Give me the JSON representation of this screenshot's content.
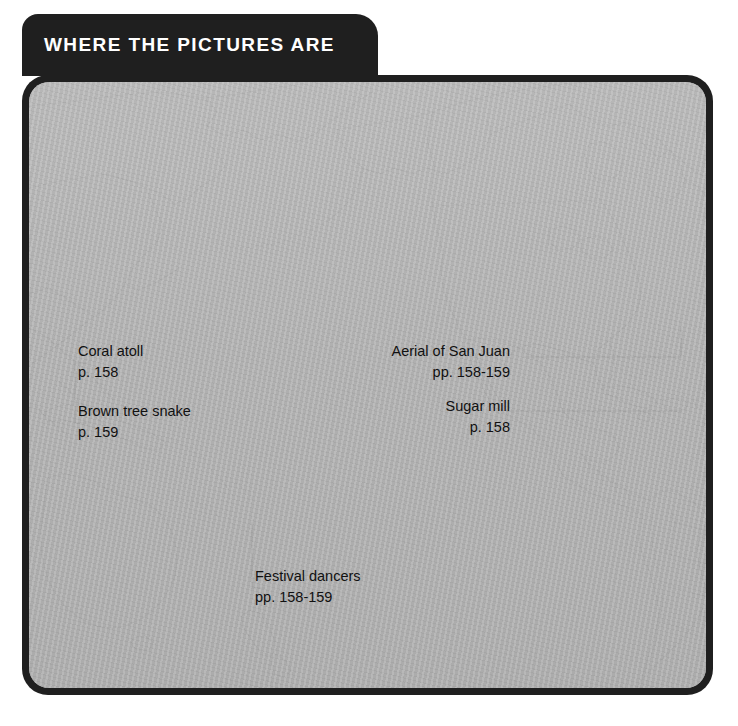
{
  "banner": {
    "title": "WHERE THE PICTURES ARE"
  },
  "theme": {
    "frame_color": "#1f1f1f",
    "banner_bg": "#1f1f1f",
    "banner_text": "#ffffff",
    "ocean_fill": "#b3b3b3",
    "coastline": "#4a4a4a",
    "label_text": "#111111",
    "leader_line": "#1a1a1a"
  },
  "callouts": [
    {
      "id": "coral-atoll",
      "name": "Coral atoll",
      "pages": "p. 158",
      "align": "left"
    },
    {
      "id": "brown-tree-snake",
      "name": "Brown tree snake",
      "pages": "p. 159",
      "align": "left"
    },
    {
      "id": "festival-dancers",
      "name": "Festival dancers",
      "pages": "pp. 158-159",
      "align": "left"
    },
    {
      "id": "aerial-san-juan",
      "name": "Aerial of San Juan",
      "pages": "pp. 158-159",
      "align": "right"
    },
    {
      "id": "sugar-mill",
      "name": "Sugar mill",
      "pages": "p. 158",
      "align": "right"
    }
  ],
  "map": {
    "projection_note": "Pacific-centered world map",
    "landmasses": [
      "Siberia / Kamchatka",
      "Alaska",
      "Aleutian Islands",
      "Canada",
      "United States",
      "Mexico / Baja California",
      "Central America",
      "Caribbean islands",
      "South America",
      "Australia",
      "New Guinea",
      "New Zealand",
      "Pacific island chains"
    ]
  }
}
